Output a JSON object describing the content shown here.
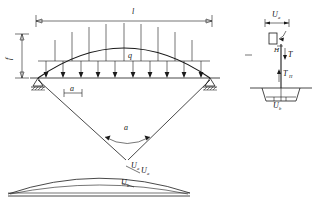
{
  "figure": {
    "line_color": "#1a1a1a",
    "background": "#ffffff"
  },
  "main_diagram": {
    "span_label": "l",
    "rise_label": "f",
    "load_label": "q",
    "spacing_label": "a",
    "load_arrow_count": 10,
    "support_left": "pin-support",
    "support_right": "roller-support"
  },
  "angle_diagram": {
    "angle_label": "a",
    "vertex_label": "U",
    "vertex_sub": "a"
  },
  "deflection_diagram": {
    "curve_upper_label": "U",
    "curve_upper_sub": "a",
    "curve_lower_label": "U",
    "curve_lower_sub": "b"
  },
  "anchor_detail": {
    "top_dim_label": "U",
    "top_dim_sub": "a",
    "plate_label": "H",
    "force_label": "T",
    "horizontal_force_label": "T",
    "horizontal_force_sub": "H",
    "bottom_label": "U",
    "bottom_sub": "b"
  }
}
